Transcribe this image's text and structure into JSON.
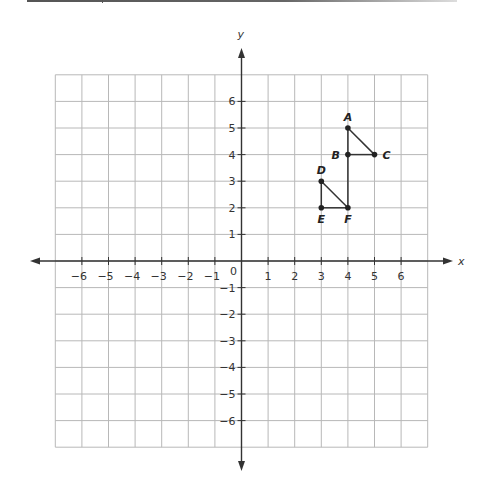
{
  "chart_data": {
    "type": "scatter",
    "title": "",
    "xlabel": "x",
    "ylabel": "y",
    "xlim": [
      -7,
      7
    ],
    "ylim": [
      -7,
      7
    ],
    "grid": true,
    "x_ticks": [
      -6,
      -5,
      -4,
      -3,
      -2,
      -1,
      1,
      2,
      3,
      4,
      5,
      6
    ],
    "y_ticks": [
      -6,
      -5,
      -4,
      -3,
      -2,
      -1,
      1,
      2,
      3,
      4,
      5,
      6
    ],
    "origin_label": "0",
    "points": [
      {
        "label": "A",
        "x": 4,
        "y": 5
      },
      {
        "label": "B",
        "x": 4,
        "y": 4
      },
      {
        "label": "C",
        "x": 5,
        "y": 4
      },
      {
        "label": "D",
        "x": 3,
        "y": 3
      },
      {
        "label": "E",
        "x": 3,
        "y": 2
      },
      {
        "label": "F",
        "x": 4,
        "y": 2
      }
    ],
    "segments": [
      [
        "A",
        "B"
      ],
      [
        "B",
        "C"
      ],
      [
        "A",
        "C"
      ],
      [
        "B",
        "F"
      ],
      [
        "D",
        "E"
      ],
      [
        "E",
        "F"
      ],
      [
        "D",
        "F"
      ]
    ]
  },
  "colors": {
    "grid": "#b8b8b8",
    "axis": "#333333",
    "shape": "#333333"
  }
}
